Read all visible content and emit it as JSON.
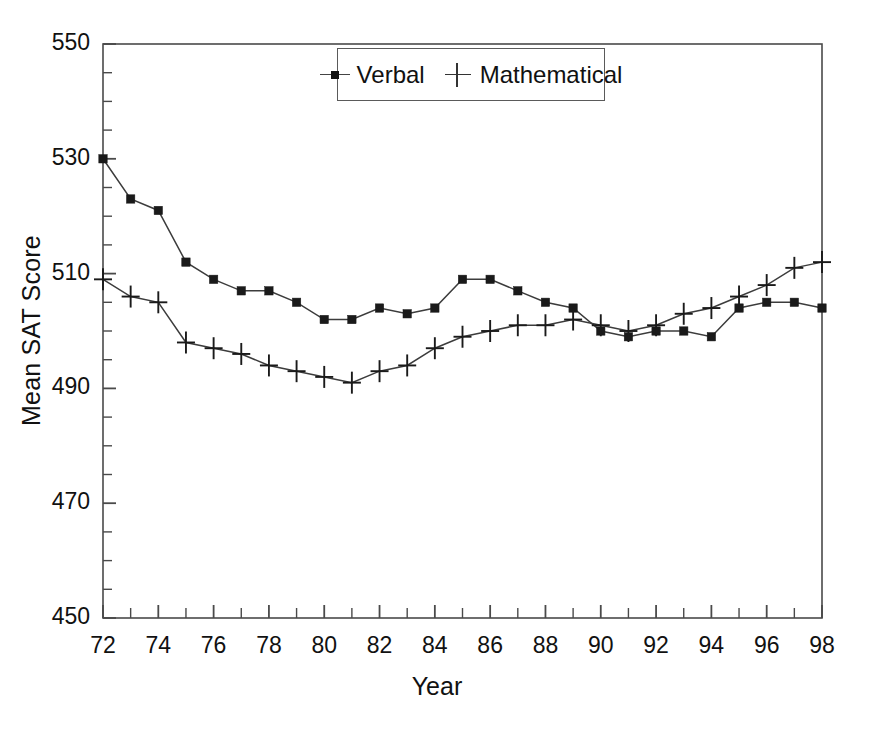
{
  "chart_data": {
    "type": "line",
    "title": "",
    "xlabel": "Year",
    "ylabel": "Mean SAT Score",
    "xlim": [
      72,
      98
    ],
    "ylim": [
      450,
      550
    ],
    "grid": false,
    "legend_position": "top-center",
    "x_major_tick_labels": [
      "72",
      "74",
      "76",
      "78",
      "80",
      "82",
      "84",
      "86",
      "88",
      "90",
      "92",
      "94",
      "96",
      "98"
    ],
    "y_major_tick_labels": [
      "450",
      "470",
      "490",
      "510",
      "530",
      "550"
    ],
    "x_minor_tick_interval": 1,
    "y_minor_tick_interval": 5,
    "x": [
      72,
      73,
      74,
      75,
      76,
      77,
      78,
      79,
      80,
      81,
      82,
      83,
      84,
      85,
      86,
      87,
      88,
      89,
      90,
      91,
      92,
      93,
      94,
      95,
      96,
      97,
      98
    ],
    "series": [
      {
        "name": "Verbal",
        "marker": "square",
        "color": "#1a1a1a",
        "values": [
          530,
          523,
          521,
          512,
          509,
          507,
          507,
          505,
          502,
          502,
          504,
          503,
          504,
          509,
          509,
          507,
          505,
          504,
          500,
          499,
          500,
          500,
          499,
          504,
          505,
          505,
          504
        ]
      },
      {
        "name": "Mathematical",
        "marker": "plus",
        "color": "#1a1a1a",
        "values": [
          509,
          506,
          505,
          498,
          497,
          496,
          494,
          493,
          492,
          491,
          493,
          494,
          497,
          499,
          500,
          501,
          501,
          502,
          501,
          500,
          501,
          503,
          504,
          506,
          508,
          511,
          512
        ]
      }
    ]
  },
  "legend": {
    "entries": [
      {
        "label": "Verbal",
        "marker": "square-marker-icon"
      },
      {
        "label": "Mathematical",
        "marker": "plus-marker-icon"
      }
    ]
  },
  "axes": {
    "x_title": "Year",
    "y_title": "Mean SAT Score"
  }
}
